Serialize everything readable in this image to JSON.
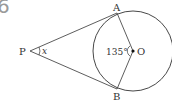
{
  "question_number": "6",
  "diagram": {
    "points": {
      "P": "P",
      "A": "A",
      "B": "B",
      "O": "O"
    },
    "angle_at_O": "135°",
    "angle_at_P": "x"
  }
}
